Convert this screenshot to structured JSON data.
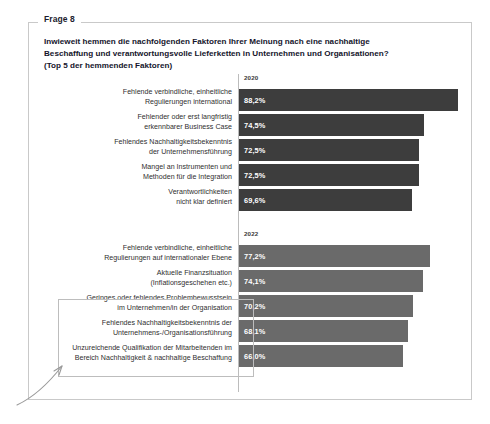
{
  "card": {
    "legend": "Frage 8"
  },
  "title": {
    "line1": "Inwieweit hemmen die nachfolgenden Faktoren Ihrer Meinung nach eine nachhaltige",
    "line2": "Beschaffung und verantwortungsvolle Lieferketten in Unternehmen und Organisationen?",
    "line3": "(Top 5 der hemmenden Faktoren)"
  },
  "colors": {
    "bar_2020": "#3d3d3d",
    "bar_2022": "#6a6a6a",
    "card_border": "#c9c9c9",
    "highlight_border": "#bdbdbd",
    "title_text": "#14142b"
  },
  "chart_data": {
    "type": "bar",
    "title": "Inwieweit hemmen die nachfolgenden Faktoren Ihrer Meinung nach eine nachhaltige Beschaffung und verantwortungsvolle Lieferketten in Unternehmen und Organisationen? (Top 5 der hemmenden Faktoren)",
    "xlabel": "",
    "ylabel": "",
    "xlim": [
      0,
      100
    ],
    "grid": false,
    "legend_position": "none",
    "orientation": "horizontal",
    "groups": [
      {
        "name": "2020",
        "color": "#3d3d3d",
        "categories": [
          "Fehlende verbindliche, einheitliche Regulierungen international",
          "Fehlender oder erst langfristig erkennbarer Business Case",
          "Fehlendes Nachhaltigkeitsbekenntnis der Unternehmensführung",
          "Mangel an Instrumenten und Methoden für die Integration",
          "Verantwortlichkeiten nicht klar definiert"
        ],
        "values": [
          88.2,
          74.5,
          72.5,
          72.5,
          69.6
        ],
        "value_labels": [
          "88,2%",
          "74,5%",
          "72,5%",
          "72,5%",
          "69,6%"
        ]
      },
      {
        "name": "2022",
        "color": "#6a6a6a",
        "categories": [
          "Fehlende verbindliche, einheitliche Regulierungen auf internationaler Ebene",
          "Aktuelle Finanzsituation (Inflationsgeschehen etc.)",
          "Geringes oder fehlendes Problembewusstsein im Unternehmen/in der Organisation",
          "Fehlendes Nachhaltigkeitsbekenntnis der Unternehmens-/Organisationsführung",
          "Unzureichende Qualifikation der Mitarbeitenden im Bereich Nachhaltigkeit & nachhaltige Beschaffung"
        ],
        "values": [
          77.2,
          74.1,
          70.2,
          68.1,
          66.0
        ],
        "value_labels": [
          "77,2%",
          "74,1%",
          "70,2%",
          "68,1%",
          "66,0%"
        ]
      }
    ]
  },
  "groups_render": [
    {
      "header": "2020",
      "rows": [
        {
          "l1": "Fehlende verbindliche, einheitliche",
          "l2": "Regulierungen international",
          "value": "88,2%"
        },
        {
          "l1": "Fehlender oder erst langfristig",
          "l2": "erkennbarer Business Case",
          "value": "74,5%"
        },
        {
          "l1": "Fehlendes Nachhaltigkeitsbekenntnis",
          "l2": "der Unternehmensführung",
          "value": "72,5%"
        },
        {
          "l1": "Mangel an Instrumenten und",
          "l2": "Methoden für die Integration",
          "value": "72,5%"
        },
        {
          "l1": "Verantwortlichkeiten",
          "l2": "nicht klar definiert",
          "value": "69,6%"
        }
      ]
    },
    {
      "header": "2022",
      "rows": [
        {
          "l1": "Fehlende verbindliche, einheitliche",
          "l2": "Regulierungen auf internationaler Ebene",
          "value": "77,2%"
        },
        {
          "l1": "Aktuelle Finanzsituation",
          "l2": "(Inflationsgeschehen etc.)",
          "value": "74,1%"
        },
        {
          "l1": "Geringes oder fehlendes Problembewusstsein",
          "l2": "im Unternehmen/in der Organisation",
          "value": "70,2%"
        },
        {
          "l1": "Fehlendes Nachhaltigkeitsbekenntnis der",
          "l2": "Unternehmens-/Organisationsführung",
          "value": "68,1%"
        },
        {
          "l1": "Unzureichende Qualifikation der Mitarbeitenden im",
          "l2": "Bereich Nachhaltigkeit & nachhaltige Beschaffung",
          "value": "66,0%"
        }
      ]
    }
  ],
  "annotations": {
    "highlight_box": "highlight-rectangle-bottom-three-factors",
    "arrow": "curved-arrow-pointing-to-highlight"
  }
}
